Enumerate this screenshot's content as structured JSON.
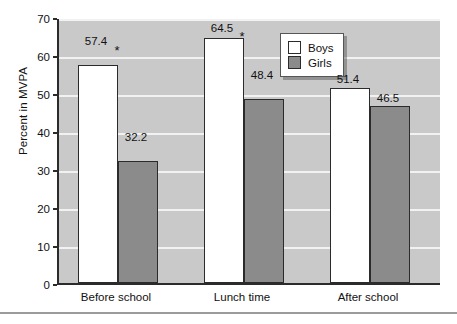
{
  "chart_data": {
    "type": "bar",
    "title": "",
    "xlabel": "",
    "ylabel": "Percent in MVPA",
    "ylim": [
      0,
      70
    ],
    "ytick_step": 10,
    "yticks": [
      0,
      10,
      20,
      30,
      40,
      50,
      60,
      70
    ],
    "grid": true,
    "legend_position": "top-right",
    "categories": [
      "Before school",
      "Lunch time",
      "After school"
    ],
    "series": [
      {
        "name": "Boys",
        "color": "#ffffff",
        "values": [
          57.4,
          64.5,
          51.4
        ]
      },
      {
        "name": "Girls",
        "color": "#8b8b8b",
        "values": [
          32.2,
          48.4,
          46.5
        ]
      }
    ],
    "value_labels": [
      [
        "57.4",
        "32.2"
      ],
      [
        "64.5",
        "48.4"
      ],
      [
        "51.4",
        "46.5"
      ]
    ],
    "annotations": [
      {
        "symbol": "*",
        "group": "Before school",
        "note": "significance marker"
      },
      {
        "symbol": "*",
        "group": "Lunch time",
        "note": "significance marker"
      }
    ],
    "colors": {
      "plot_background": "#c9c9c9",
      "gridline": "#f2f2f2",
      "axis": "#2b2b2b",
      "boys_bar": "#ffffff",
      "girls_bar": "#8b8b8b",
      "page_background": "#ffffff",
      "divider": "#9b9b9b"
    }
  },
  "ytick_labels": {
    "t0": "0",
    "t10": "10",
    "t20": "20",
    "t30": "30",
    "t40": "40",
    "t50": "50",
    "t60": "60",
    "t70": "70"
  },
  "axis": {
    "ylabel": "Percent in MVPA"
  },
  "legend": {
    "boys": "Boys",
    "girls": "Girls"
  },
  "xcats": {
    "c0": "Before school",
    "c1": "Lunch time",
    "c2": "After school"
  },
  "labels": {
    "g0b": "57.4",
    "g0g": "32.2",
    "g1b": "64.5",
    "g1g": "48.4",
    "g2b": "51.4",
    "g2g": "46.5"
  },
  "stars": {
    "s0": "*",
    "s1": "*"
  }
}
